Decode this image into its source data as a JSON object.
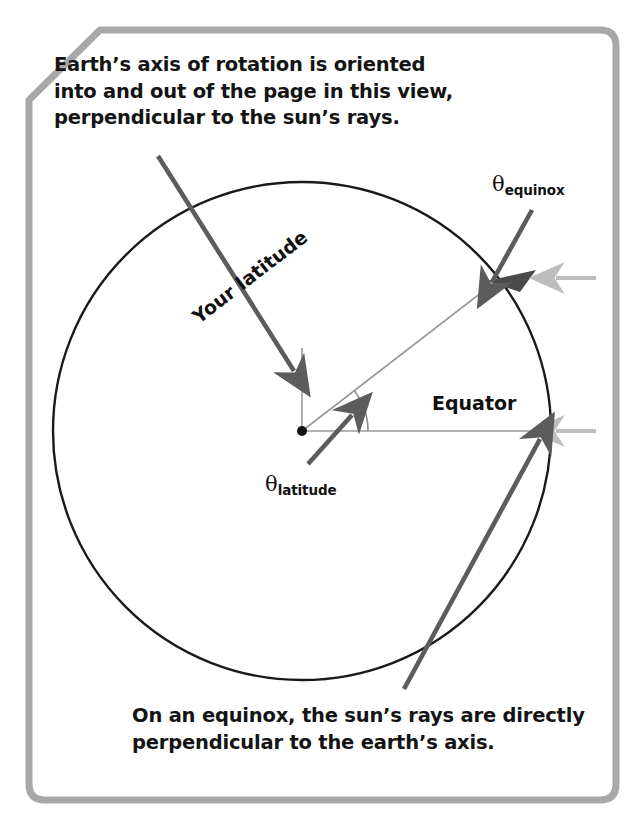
{
  "figure": {
    "type": "diagram",
    "frame_color": "#a8a8a8",
    "background": "#ffffff"
  },
  "captions": {
    "top": "Earth’s axis of rotation is oriented into and out of the page in this view, perpendicular to the sun’s rays.",
    "bottom": "On an equinox, the sun’s rays are directly perpendicular to the earth’s axis."
  },
  "labels": {
    "equator": "Equator",
    "your_latitude": "Your latitude",
    "theta_equinox": {
      "symbol": "θ",
      "subscript": "equinox"
    },
    "theta_latitude": {
      "symbol": "θ",
      "subscript": "latitude"
    }
  },
  "geometry": {
    "center": {
      "x": 302,
      "y": 431
    },
    "radius": 249,
    "latitude_angle_deg": 37.5,
    "equator_line": {
      "from_x": 302,
      "to_x": 551,
      "y": 431
    },
    "axis_line": {
      "x": 302,
      "from_y": 431,
      "to_y": 348
    },
    "angle_arc_radius": 66
  },
  "colors": {
    "circle_stroke": "#1a1a1a",
    "thin_line": "#9a9a9a",
    "annotation_arrow": "#5c5c5c",
    "sun_ray": "#bdbdbd",
    "wedge_fill": "#4a4a4a",
    "text": "#141414"
  },
  "sun_rays": [
    {
      "name": "ray-latitude",
      "y": 278,
      "from_x": 596,
      "to_x": 552,
      "direction": "left"
    },
    {
      "name": "ray-equator",
      "y": 431,
      "from_x": 596,
      "to_x": 552,
      "direction": "left"
    }
  ],
  "annotation_arrows": [
    {
      "name": "arrow-axis",
      "from": [
        158,
        156
      ],
      "to": [
        296,
        374
      ]
    },
    {
      "name": "arrow-equinox",
      "from": [
        530,
        212
      ],
      "to": [
        489,
        285
      ]
    },
    {
      "name": "arrow-latitude",
      "from": [
        310,
        462
      ],
      "to": [
        354,
        413
      ]
    },
    {
      "name": "arrow-equator-point",
      "from": [
        404,
        689
      ],
      "to": [
        541,
        437
      ]
    }
  ]
}
